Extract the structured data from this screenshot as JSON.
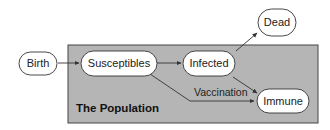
{
  "diagram": {
    "region": {
      "label": "The Population",
      "fill": "#b5b5b5"
    },
    "nodes": {
      "birth": "Birth",
      "susceptibles": "Susceptibles",
      "infected": "Infected",
      "dead": "Dead",
      "immune": "Immune"
    },
    "edges": [
      {
        "from": "Birth",
        "to": "Susceptibles",
        "label": ""
      },
      {
        "from": "Susceptibles",
        "to": "Infected",
        "label": ""
      },
      {
        "from": "Infected",
        "to": "Dead",
        "label": ""
      },
      {
        "from": "Infected",
        "to": "Immune",
        "label": ""
      },
      {
        "from": "Susceptibles",
        "to": "Immune",
        "label": "Vaccination"
      }
    ]
  }
}
